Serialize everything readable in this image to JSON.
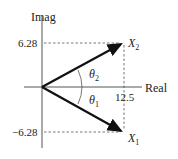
{
  "diagram": {
    "type": "complex-plane-phasor",
    "axes": {
      "vertical_label": "Imag",
      "horizontal_label": "Real"
    },
    "ticks": {
      "y_positive": "6.28",
      "y_negative": "−6.28",
      "x_value": "12.5"
    },
    "vectors": [
      {
        "name": "X",
        "subscript": "2",
        "real": 12.5,
        "imag": 6.28
      },
      {
        "name": "X",
        "subscript": "1",
        "real": 12.5,
        "imag": -6.28
      }
    ],
    "angles": [
      {
        "symbol": "θ",
        "subscript": "2"
      },
      {
        "symbol": "θ",
        "subscript": "1"
      }
    ],
    "colors": {
      "axis": "#555555",
      "vector": "#111111",
      "dashed": "#555555",
      "text": "#222222"
    }
  }
}
